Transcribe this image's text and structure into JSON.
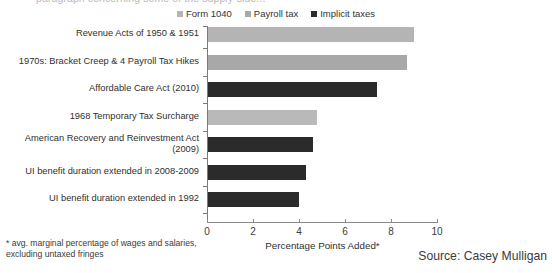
{
  "top_clipped_title": "paragraph concerning some of the supply-side...",
  "legend": {
    "position": "top-center",
    "items": [
      {
        "label": "Form 1040",
        "color": "#b4b4b4",
        "icon": "square-swatch-icon"
      },
      {
        "label": "Payroll tax",
        "color": "#a8a8a8",
        "icon": "square-swatch-icon"
      },
      {
        "label": "Implicit taxes",
        "color": "#2b2b2b",
        "icon": "square-swatch-icon"
      }
    ]
  },
  "axis": {
    "x_ticks": [
      "0",
      "2",
      "4",
      "6",
      "8",
      "10"
    ],
    "x_title": "Percentage Points Added*",
    "x_min": 0,
    "x_max": 10
  },
  "footnote": "* avg. marginal percentage of wages and salaries, excluding untaxed fringes",
  "source": "Source: Casey Mulligan",
  "chart_data": {
    "type": "bar",
    "orientation": "horizontal",
    "title": "",
    "xlabel": "Percentage Points Added*",
    "ylabel": "",
    "xlim": [
      0,
      10
    ],
    "grid": false,
    "legend_position": "top-center",
    "legend": [
      "Form 1040",
      "Payroll tax",
      "Implicit taxes"
    ],
    "categories": [
      "Revenue Acts of 1950 & 1951",
      "1970s: Bracket Creep & 4 Payroll Tax Hikes",
      "Affordable Care Act (2010)",
      "1968 Temporary Tax Surcharge",
      "American Recovery and Reinvestment Act\n(2009)",
      "UI benefit duration extended in 2008-2009",
      "UI benefit duration extended in 1992"
    ],
    "values": [
      9.0,
      8.7,
      7.4,
      4.8,
      4.6,
      4.3,
      4.0
    ],
    "series_of_bar": [
      "Form 1040",
      "Payroll tax",
      "Implicit taxes",
      "Form 1040",
      "Implicit taxes",
      "Implicit taxes",
      "Implicit taxes"
    ],
    "bar_colors": [
      "#b4b4b4",
      "#a8a8a8",
      "#2b2b2b",
      "#b9b9b9",
      "#2b2b2b",
      "#2b2b2b",
      "#2b2b2b"
    ],
    "bars": [
      {
        "category": "Revenue Acts of 1950 & 1951",
        "value": 9.0,
        "series": "Form 1040",
        "color": "#b4b4b4"
      },
      {
        "category": "1970s: Bracket Creep & 4 Payroll Tax Hikes",
        "value": 8.7,
        "series": "Payroll tax",
        "color": "#a8a8a8"
      },
      {
        "category": "Affordable Care Act (2010)",
        "value": 7.4,
        "series": "Implicit taxes",
        "color": "#2b2b2b"
      },
      {
        "category": "1968 Temporary Tax Surcharge",
        "value": 4.8,
        "series": "Form 1040",
        "color": "#b9b9b9"
      },
      {
        "category": "American Recovery and Reinvestment Act (2009)",
        "value": 4.6,
        "series": "Implicit taxes",
        "color": "#2b2b2b"
      },
      {
        "category": "UI benefit duration extended in 2008-2009",
        "value": 4.3,
        "series": "Implicit taxes",
        "color": "#2b2b2b"
      },
      {
        "category": "UI benefit duration extended in 1992",
        "value": 4.0,
        "series": "Implicit taxes",
        "color": "#2b2b2b"
      }
    ]
  }
}
